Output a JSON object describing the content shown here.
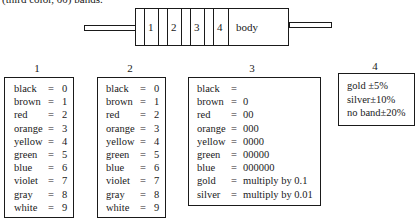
{
  "caption": "(third color, 00) bands.",
  "resistor": {
    "band_labels": [
      "1",
      "2",
      "3",
      "4"
    ],
    "body_label": "body"
  },
  "tables": [
    {
      "header": "1",
      "rows": [
        {
          "color": "black",
          "eq": "=",
          "value": "0"
        },
        {
          "color": "brown",
          "eq": "=",
          "value": "1"
        },
        {
          "color": "red",
          "eq": "=",
          "value": "2"
        },
        {
          "color": "orange",
          "eq": "=",
          "value": "3"
        },
        {
          "color": "yellow",
          "eq": "=",
          "value": "4"
        },
        {
          "color": "green",
          "eq": "=",
          "value": "5"
        },
        {
          "color": "blue",
          "eq": "=",
          "value": "6"
        },
        {
          "color": "violet",
          "eq": "=",
          "value": "7"
        },
        {
          "color": "gray",
          "eq": "=",
          "value": "8"
        },
        {
          "color": "white",
          "eq": "=",
          "value": "9"
        }
      ]
    },
    {
      "header": "2",
      "rows": [
        {
          "color": "black",
          "eq": "=",
          "value": "0"
        },
        {
          "color": "brown",
          "eq": "=",
          "value": "1"
        },
        {
          "color": "red",
          "eq": "=",
          "value": "2"
        },
        {
          "color": "orange",
          "eq": "=",
          "value": "3"
        },
        {
          "color": "yellow",
          "eq": "=",
          "value": "4"
        },
        {
          "color": "green",
          "eq": "=",
          "value": "5"
        },
        {
          "color": "blue",
          "eq": "=",
          "value": "6"
        },
        {
          "color": "violet",
          "eq": "=",
          "value": "7"
        },
        {
          "color": "gray",
          "eq": "=",
          "value": "8"
        },
        {
          "color": "white",
          "eq": "=",
          "value": "9"
        }
      ]
    },
    {
      "header": "3",
      "rows": [
        {
          "color": "black",
          "eq": "=",
          "value": ""
        },
        {
          "color": "brown",
          "eq": "=",
          "value": "0"
        },
        {
          "color": "red",
          "eq": "=",
          "value": "00"
        },
        {
          "color": "orange",
          "eq": "=",
          "value": "000"
        },
        {
          "color": "yellow",
          "eq": "=",
          "value": "0000"
        },
        {
          "color": "green",
          "eq": "=",
          "value": "00000"
        },
        {
          "color": "blue",
          "eq": "=",
          "value": "000000"
        },
        {
          "color": "gold",
          "eq": "=",
          "value": "multiply by 0.1"
        },
        {
          "color": "silver",
          "eq": "=",
          "value": "multiply by 0.01"
        }
      ]
    },
    {
      "header": "4",
      "rows": [
        {
          "text": "gold ±5%"
        },
        {
          "text": "silver±10%"
        },
        {
          "text": "no band±20%"
        }
      ]
    }
  ]
}
